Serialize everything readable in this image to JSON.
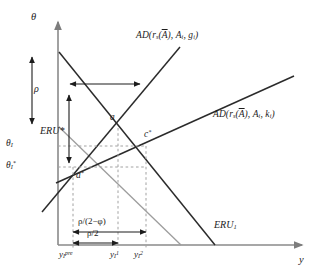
{
  "figure": {
    "type": "economics-line-diagram",
    "background": "#ffffff",
    "line_color": "#2b2b2b",
    "axis_color": "#8a8a8a",
    "dashed_color": "#9a9a9a",
    "width": 321,
    "height": 280
  },
  "axes": {
    "y_axis_label": "θ",
    "x_axis_label": "y",
    "x_origin_px": 58,
    "y_origin_px": 245,
    "x_end_px": 300,
    "y_top_px": 20
  },
  "curves": [
    {
      "id": "ad_g",
      "label": "AD(r_s(Ā), A_i, g_i)",
      "label_parts": {
        "prefix": "AD(r",
        "sub1": "s",
        "mid": "(",
        "overline": "A",
        "after_overline": "), A",
        "sub2": "i",
        "comma": ", g",
        "sub3": "i",
        "suffix": ")"
      },
      "label_x": 136,
      "label_y": 33,
      "direction": "upward-sloping",
      "color": "#2b2b2b"
    },
    {
      "id": "ad_k",
      "label": "AD(r_s(Ā), A_i, k_i)",
      "label_parts": {
        "prefix": "AD(r",
        "sub1": "s",
        "mid": "(",
        "overline": "A",
        "after_overline": "), A",
        "sub2": "i",
        "comma": ", k",
        "sub3": "i",
        "suffix": ")"
      },
      "label_x": 215,
      "label_y": 112,
      "direction": "upward-sloping-shallow",
      "color": "#2b2b2b"
    },
    {
      "id": "eru_star",
      "label": "ERU*",
      "label_x": 40,
      "label_y": 130,
      "direction": "downward-sloping",
      "color": "#8f8f8f"
    },
    {
      "id": "eru_1",
      "label": "ERU",
      "label_sub": "1",
      "label_x": 215,
      "label_y": 223,
      "direction": "downward-sloping",
      "color": "#2b2b2b"
    }
  ],
  "points": [
    {
      "id": "a",
      "label": "a",
      "label_x": 110,
      "label_y": 115,
      "x_px": 118,
      "y_px": 128
    },
    {
      "id": "c_star",
      "label": "c",
      "label_sup": "*",
      "label_x": 144,
      "label_y": 131,
      "x_px": 146,
      "y_px": 146
    },
    {
      "id": "a_star",
      "label": "a",
      "label_sup": "*",
      "label_x": 76,
      "label_y": 173,
      "x_px": 73,
      "y_px": 167
    }
  ],
  "y_ticks": [
    {
      "id": "theta_I",
      "label": "θ",
      "sub": "I",
      "sup": "",
      "y_px": 146,
      "label_x": 6,
      "label_y": 140
    },
    {
      "id": "theta_I_star",
      "label": "θ",
      "sub": "I",
      "sup": "*",
      "y_px": 167,
      "label_x": 6,
      "label_y": 160
    }
  ],
  "x_ticks": [
    {
      "id": "y_pre",
      "label": "y",
      "sub": "I",
      "sup": "pre",
      "x_px": 73,
      "label_x": 60,
      "label_y": 251
    },
    {
      "id": "y_1",
      "label": "y",
      "sub": "I",
      "sup": "1",
      "x_px": 118,
      "label_x": 110,
      "label_y": 251
    },
    {
      "id": "y_2",
      "label": "y",
      "sub": "I",
      "sup": "2",
      "x_px": 146,
      "label_x": 134,
      "label_y": 251
    }
  ],
  "annotations": [
    {
      "id": "rho_vertical",
      "label": "ρ",
      "label_x": 32,
      "label_y": 85,
      "type": "double-arrow-vertical",
      "x_px": 32,
      "y1_px": 57,
      "y2_px": 124
    },
    {
      "id": "rho_horizontal_top",
      "label": "",
      "type": "double-arrow-horizontal",
      "y_px": 84,
      "x1_px": 70,
      "x2_px": 140
    },
    {
      "id": "rho_vertical_second",
      "label": "",
      "type": "double-arrow-vertical",
      "x_px": 69,
      "y1_px": 95,
      "y2_px": 163
    },
    {
      "id": "rho_over_2_minus_phi",
      "label": "ρ/(2−φ)",
      "label_x": 78,
      "label_y": 218,
      "type": "double-arrow-horizontal",
      "y_px": 232,
      "x1_px": 73,
      "x2_px": 146
    },
    {
      "id": "rho_over_2",
      "label": "ρ/2",
      "label_x": 88,
      "label_y": 232,
      "type": "double-arrow-horizontal",
      "y_px": 243,
      "x1_px": 73,
      "x2_px": 118
    }
  ]
}
